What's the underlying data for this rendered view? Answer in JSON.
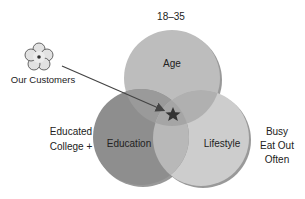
{
  "diagram": {
    "type": "venn",
    "circles": [
      {
        "id": "age",
        "label": "Age",
        "outer_label": "18–35",
        "color": "#bdbdbd"
      },
      {
        "id": "education",
        "label": "Education",
        "outer_label_lines": [
          "Educated",
          "College +"
        ],
        "color": "#8a8a8a"
      },
      {
        "id": "lifestyle",
        "label": "Lifestyle",
        "outer_label_lines": [
          "Busy",
          "Eat Out",
          "Often"
        ],
        "color": "#cfcfcf"
      }
    ],
    "callout": {
      "label": "Our Customers",
      "icon": "flower-icon",
      "target": "star-icon"
    }
  }
}
